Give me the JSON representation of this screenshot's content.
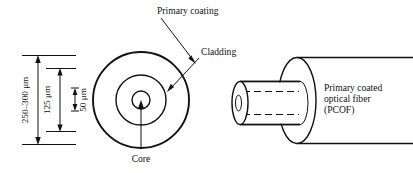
{
  "figure": {
    "background_color": "#ffffff",
    "line_color": "#111111"
  },
  "labels": {
    "primary_coating": "Primary coating",
    "cladding": "Cladding",
    "core": "Core",
    "pcof_line1": "Primary coated",
    "pcof_line2": "optical fiber",
    "pcof_line3": "(PCOF)"
  },
  "dimensions": [
    {
      "id": "coating-diameter",
      "value": "250–300 μm",
      "describes": "primary coating outer diameter"
    },
    {
      "id": "cladding-diameter",
      "value": "125 μm",
      "describes": "cladding diameter"
    },
    {
      "id": "core-diameter",
      "value": "50 μm",
      "describes": "core diameter"
    }
  ],
  "cross_section": {
    "center_x": 141,
    "center_y": 100,
    "rings": [
      {
        "name": "primary-coating-circle",
        "radius": 48
      },
      {
        "name": "cladding-circle",
        "radius": 25
      },
      {
        "name": "core-circle",
        "radius": 9
      }
    ]
  },
  "perspective_view": {
    "inner_fiber": {
      "name": "glass-fiber-cylinder"
    },
    "outer_coating": {
      "name": "coating-cylinder"
    }
  }
}
